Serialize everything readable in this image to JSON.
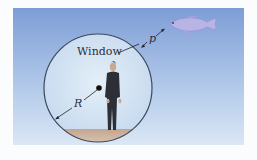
{
  "figure": {
    "type": "diagram",
    "labels": {
      "window": "Window",
      "p": "p",
      "R": "R"
    },
    "colors": {
      "water_top": "#7f9fd8",
      "water_bottom": "#cfe0f3",
      "sphere_inside": "#d6e6f5",
      "sphere_outline": "#3d4a5e",
      "floor": "#c9ab94",
      "fish": "#b9b4e6",
      "person": "#2c3036"
    }
  }
}
